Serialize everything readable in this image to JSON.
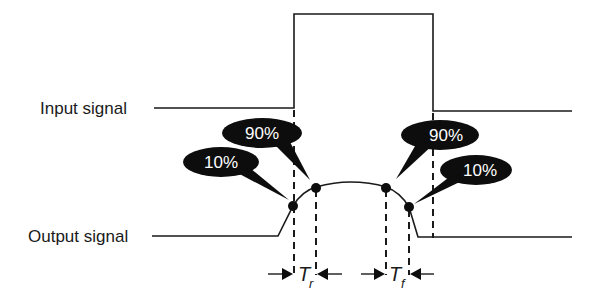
{
  "diagram": {
    "labels": {
      "input_signal": "Input signal",
      "output_signal": "Output signal"
    },
    "callouts": {
      "rise_10": "10%",
      "rise_90": "90%",
      "fall_90": "90%",
      "fall_10": "10%"
    },
    "timing": {
      "rise_main": "T",
      "rise_sub": "r",
      "fall_main": "T",
      "fall_sub": "f"
    },
    "colors": {
      "line": "#1a1a1a",
      "bubble_fill": "#0d0d0d",
      "bubble_text": "#ffffff",
      "background": "#ffffff"
    }
  }
}
